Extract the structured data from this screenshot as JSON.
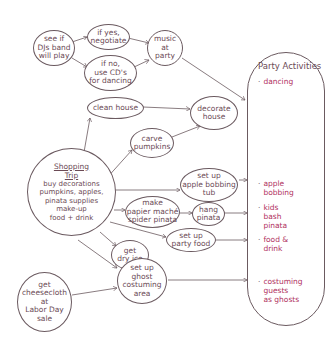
{
  "diagram": {
    "colors": {
      "line": "#6b5a60",
      "text": "#6b4a55",
      "activity_text": "#b03060",
      "background": "#ffffff"
    },
    "nodes": {
      "band": "see if\nDJs band\nwill play",
      "yes": "if yes,\nnegotiate",
      "no": "if no,\nuse CD's\nfor dancing",
      "music": "music\nat\nparty",
      "clean": "clean house",
      "decorate": "decorate\nhouse",
      "carve": "carve\npumpkins",
      "shopping_title": "Shopping\nTrip",
      "shopping_items": "buy decorations\npumpkins, apples,\npinata supplies\nmake-up\nfood + drink",
      "bobbing": "set up\napple bobbing\ntub",
      "pinata_make": "make\npapier maché\nspider pinata",
      "pinata_hang": "hang\npinata",
      "party_food": "set up\nparty food",
      "dry_ice": "get\ndry ice",
      "ghost_area": "set up\nghost\ncostuming\narea",
      "cheesecloth": "get\ncheesecloth\nat\nLabor Day\nsale"
    },
    "panel": {
      "title": "Party Activities",
      "activities": [
        {
          "bullet": "·",
          "text": "dancing"
        },
        {
          "bullet": "·",
          "text": "apple\nbobbing"
        },
        {
          "bullet": "·",
          "text": "kids\nbash\npinata"
        },
        {
          "bullet": "·",
          "text": "food &\ndrink"
        },
        {
          "bullet": "·",
          "text": "costuming\nguests\nas ghosts"
        }
      ]
    }
  }
}
